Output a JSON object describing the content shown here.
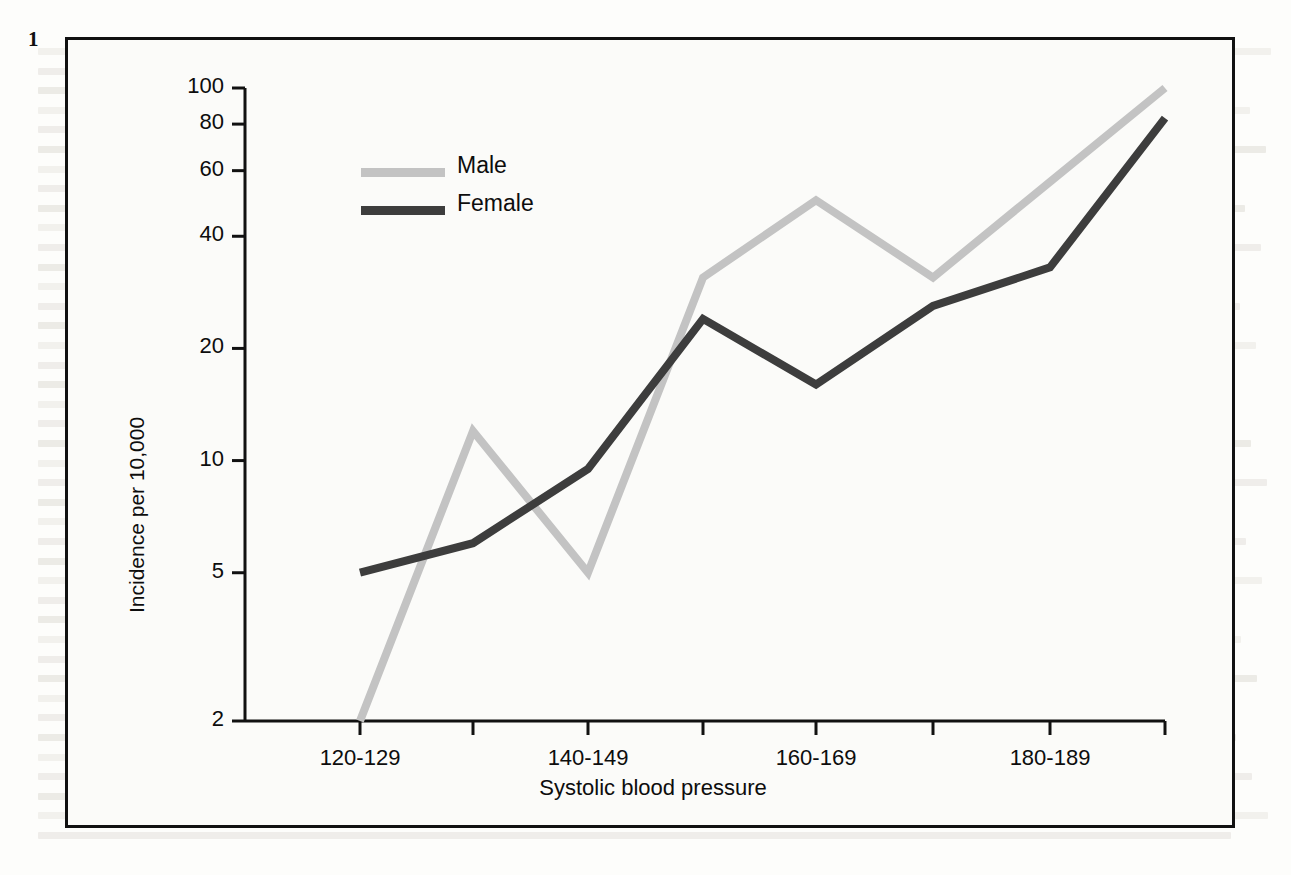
{
  "figure": {
    "number": "1"
  },
  "chart_data": {
    "type": "line",
    "title": "",
    "xlabel": "Systolic blood pressure",
    "ylabel": "Incidence per 10,000",
    "yscale": "log",
    "ylim": [
      2,
      100
    ],
    "ytick_labels": [
      "2",
      "5",
      "10",
      "20",
      "40",
      "60",
      "80",
      "100"
    ],
    "ytick_values": [
      2,
      5,
      10,
      20,
      40,
      60,
      80,
      100
    ],
    "grid": false,
    "legend_position": "upper-left",
    "categories": [
      "120-129",
      "130-139",
      "140-149",
      "150-159",
      "160-169",
      "170-179",
      "180-189",
      "190-199"
    ],
    "xtick_labels": [
      "120-129",
      "",
      "140-149",
      "",
      "160-169",
      "",
      "180-189",
      ""
    ],
    "series": [
      {
        "name": "Male",
        "color": "#c3c3c3",
        "values": [
          2,
          12,
          5,
          31,
          50,
          31,
          56,
          100
        ]
      },
      {
        "name": "Female",
        "color": "#3d3d3d",
        "values": [
          5,
          6,
          9.5,
          24,
          16,
          26,
          33,
          83
        ]
      }
    ]
  },
  "legend": {
    "entries": [
      {
        "label": "Male",
        "color": "#c3c3c3"
      },
      {
        "label": "Female",
        "color": "#3d3d3d"
      }
    ]
  }
}
